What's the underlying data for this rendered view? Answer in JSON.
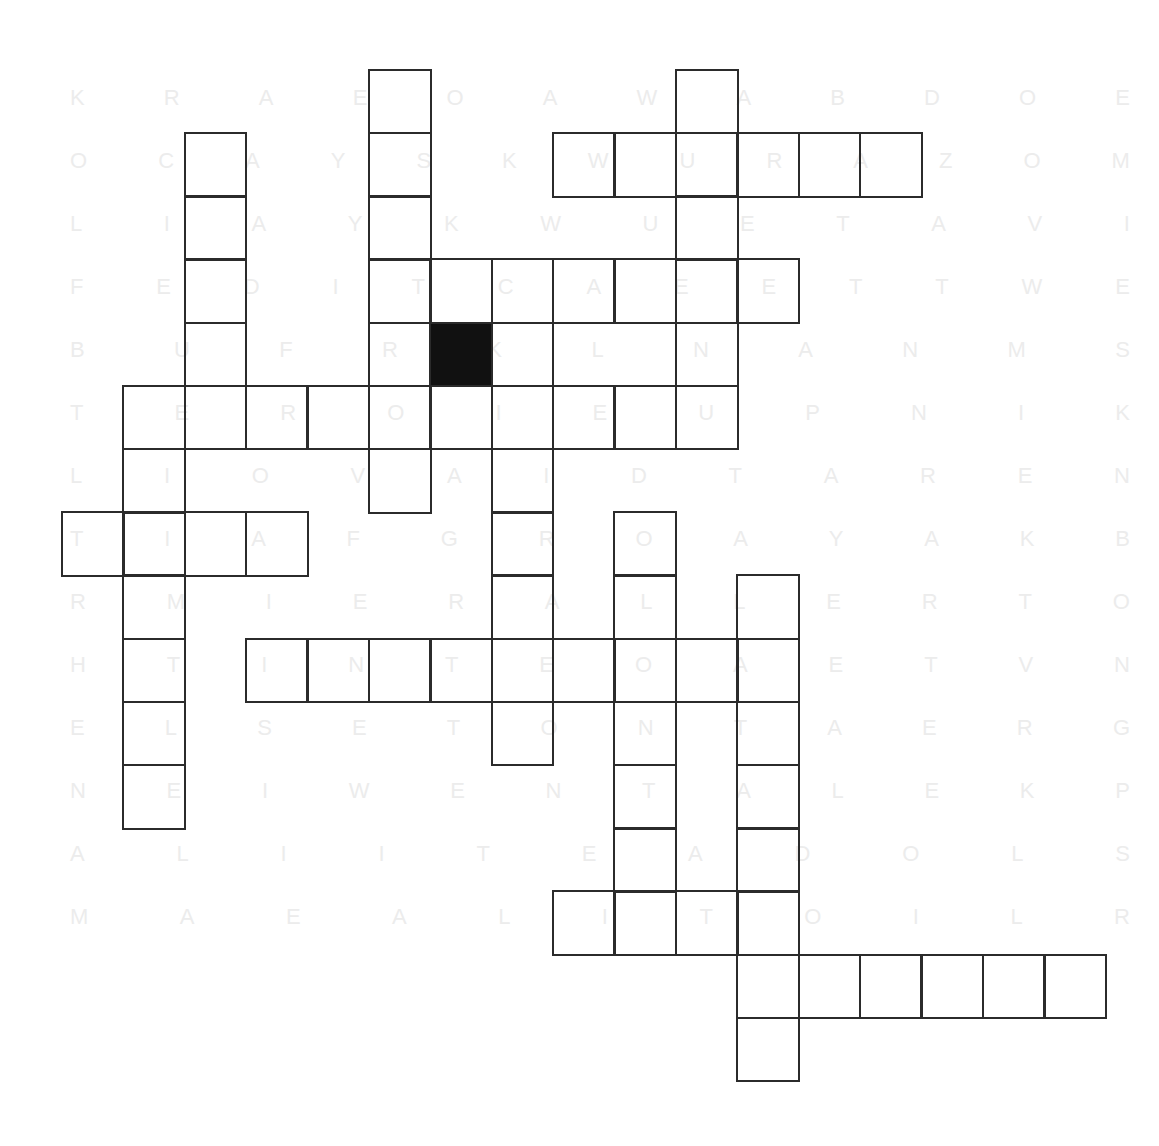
{
  "puzzle": {
    "type": "crossword",
    "origin": {
      "x": 62,
      "y": 70
    },
    "cell_width": 61.4,
    "cell_height": 63.2,
    "colors": {
      "border": "#2b2b2b",
      "black_cell": "#111111",
      "background": "#ffffff",
      "ghost_text": "#ececec"
    },
    "cells": [
      {
        "r": 0,
        "c": 5
      },
      {
        "r": 0,
        "c": 10
      },
      {
        "r": 1,
        "c": 2
      },
      {
        "r": 1,
        "c": 5
      },
      {
        "r": 1,
        "c": 8
      },
      {
        "r": 1,
        "c": 9
      },
      {
        "r": 1,
        "c": 10
      },
      {
        "r": 1,
        "c": 11
      },
      {
        "r": 1,
        "c": 12
      },
      {
        "r": 1,
        "c": 13
      },
      {
        "r": 2,
        "c": 2
      },
      {
        "r": 2,
        "c": 5
      },
      {
        "r": 2,
        "c": 10
      },
      {
        "r": 3,
        "c": 2
      },
      {
        "r": 3,
        "c": 5
      },
      {
        "r": 3,
        "c": 6
      },
      {
        "r": 3,
        "c": 7
      },
      {
        "r": 3,
        "c": 8
      },
      {
        "r": 3,
        "c": 9
      },
      {
        "r": 3,
        "c": 10
      },
      {
        "r": 3,
        "c": 11
      },
      {
        "r": 4,
        "c": 2
      },
      {
        "r": 4,
        "c": 5
      },
      {
        "r": 4,
        "c": 6,
        "black": true
      },
      {
        "r": 4,
        "c": 7
      },
      {
        "r": 4,
        "c": 10
      },
      {
        "r": 5,
        "c": 1
      },
      {
        "r": 5,
        "c": 2
      },
      {
        "r": 5,
        "c": 3
      },
      {
        "r": 5,
        "c": 4
      },
      {
        "r": 5,
        "c": 5
      },
      {
        "r": 5,
        "c": 6
      },
      {
        "r": 5,
        "c": 7
      },
      {
        "r": 5,
        "c": 8
      },
      {
        "r": 5,
        "c": 9
      },
      {
        "r": 5,
        "c": 10
      },
      {
        "r": 6,
        "c": 1
      },
      {
        "r": 6,
        "c": 5
      },
      {
        "r": 6,
        "c": 7
      },
      {
        "r": 7,
        "c": 0
      },
      {
        "r": 7,
        "c": 1
      },
      {
        "r": 7,
        "c": 2
      },
      {
        "r": 7,
        "c": 3
      },
      {
        "r": 7,
        "c": 7
      },
      {
        "r": 7,
        "c": 9
      },
      {
        "r": 8,
        "c": 1
      },
      {
        "r": 8,
        "c": 7
      },
      {
        "r": 8,
        "c": 9
      },
      {
        "r": 8,
        "c": 11
      },
      {
        "r": 9,
        "c": 1
      },
      {
        "r": 9,
        "c": 3
      },
      {
        "r": 9,
        "c": 4
      },
      {
        "r": 9,
        "c": 5
      },
      {
        "r": 9,
        "c": 6
      },
      {
        "r": 9,
        "c": 7
      },
      {
        "r": 9,
        "c": 8
      },
      {
        "r": 9,
        "c": 9
      },
      {
        "r": 9,
        "c": 10
      },
      {
        "r": 9,
        "c": 11
      },
      {
        "r": 10,
        "c": 1
      },
      {
        "r": 10,
        "c": 7
      },
      {
        "r": 10,
        "c": 9
      },
      {
        "r": 10,
        "c": 11
      },
      {
        "r": 11,
        "c": 1
      },
      {
        "r": 11,
        "c": 9
      },
      {
        "r": 11,
        "c": 11
      },
      {
        "r": 12,
        "c": 9
      },
      {
        "r": 12,
        "c": 11
      },
      {
        "r": 13,
        "c": 8
      },
      {
        "r": 13,
        "c": 9
      },
      {
        "r": 13,
        "c": 10
      },
      {
        "r": 13,
        "c": 11
      },
      {
        "r": 14,
        "c": 11
      },
      {
        "r": 14,
        "c": 12
      },
      {
        "r": 14,
        "c": 13
      },
      {
        "r": 14,
        "c": 14
      },
      {
        "r": 14,
        "c": 15
      },
      {
        "r": 14,
        "c": 16
      },
      {
        "r": 15,
        "c": 11
      }
    ]
  },
  "ghost_rows": [
    {
      "y": 85,
      "letters": [
        "K",
        "R",
        "A",
        "E",
        "O",
        "A",
        "W",
        "A",
        "B",
        "D",
        "O",
        "E"
      ]
    },
    {
      "y": 148,
      "letters": [
        "O",
        "C",
        "A",
        "Y",
        "S",
        "K",
        "W",
        "U",
        "R",
        "A",
        "Z",
        "O",
        "M"
      ]
    },
    {
      "y": 211,
      "letters": [
        "L",
        "I",
        "A",
        "Y",
        "K",
        "W",
        "U",
        "E",
        "T",
        "A",
        "V",
        "I"
      ]
    },
    {
      "y": 274,
      "letters": [
        "F",
        "E",
        "D",
        "I",
        "T",
        "C",
        "A",
        "E",
        "E",
        "T",
        "T",
        "W",
        "E"
      ]
    },
    {
      "y": 337,
      "letters": [
        "B",
        "U",
        "F",
        "R",
        "K",
        "L",
        "N",
        "A",
        "N",
        "M",
        "S"
      ]
    },
    {
      "y": 400,
      "letters": [
        "T",
        "E",
        "R",
        "O",
        "I",
        "E",
        "U",
        "P",
        "N",
        "I",
        "K"
      ]
    },
    {
      "y": 463,
      "letters": [
        "L",
        "I",
        "O",
        "V",
        "A",
        "I",
        "D",
        "T",
        "A",
        "R",
        "E",
        "N"
      ]
    },
    {
      "y": 526,
      "letters": [
        "T",
        "I",
        "A",
        "F",
        "G",
        "R",
        "O",
        "A",
        "Y",
        "A",
        "K",
        "B"
      ]
    },
    {
      "y": 589,
      "letters": [
        "R",
        "M",
        "I",
        "E",
        "R",
        "A",
        "L",
        "L",
        "E",
        "R",
        "T",
        "O"
      ]
    },
    {
      "y": 652,
      "letters": [
        "H",
        "T",
        "I",
        "N",
        "T",
        "E",
        "O",
        "A",
        "E",
        "T",
        "V",
        "N"
      ]
    },
    {
      "y": 715,
      "letters": [
        "E",
        "L",
        "S",
        "E",
        "T",
        "O",
        "N",
        "T",
        "A",
        "E",
        "R",
        "G"
      ]
    },
    {
      "y": 778,
      "letters": [
        "N",
        "E",
        "I",
        "W",
        "E",
        "N",
        "T",
        "A",
        "L",
        "E",
        "K",
        "P"
      ]
    },
    {
      "y": 841,
      "letters": [
        "A",
        "L",
        "I",
        "I",
        "T",
        "E",
        "A",
        "D",
        "O",
        "L",
        "S"
      ]
    },
    {
      "y": 904,
      "letters": [
        "M",
        "A",
        "E",
        "A",
        "L",
        "I",
        "T",
        "O",
        "I",
        "L",
        "R"
      ]
    }
  ]
}
